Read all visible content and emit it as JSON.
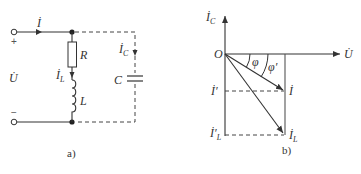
{
  "figure_a": {
    "caption": "a)",
    "labels": {
      "current_total": "İ",
      "voltage": "U̇",
      "resistor": "R",
      "inductor": "L",
      "capacitor": "C",
      "current_inductor": "İ",
      "current_inductor_sub": "L",
      "current_capacitor": "İ",
      "current_capacitor_sub": "C",
      "plus": "+",
      "minus": "−"
    }
  },
  "figure_b": {
    "caption": "b)",
    "labels": {
      "axis_y": "İ",
      "axis_y_sub": "C",
      "axis_x": "U̇",
      "origin": "O",
      "angle_phi": "φ",
      "angle_phi_prime": "φ′",
      "current_total": "İ",
      "current_total_prime": "İ′",
      "current_inductor": "İ",
      "current_inductor_sub": "L",
      "current_inductor_prime": "İ′",
      "current_inductor_prime_sub": "L"
    }
  },
  "colors": {
    "line": "#333333",
    "background": "#ffffff"
  }
}
